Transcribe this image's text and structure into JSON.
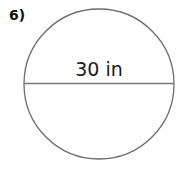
{
  "problem": {
    "number": "6)"
  },
  "diagram": {
    "shape": "circle",
    "measurement_label": "30 in",
    "measured_segment": "diameter",
    "stroke_color": "#6b6b6b",
    "text_color": "#1a1a1a"
  }
}
